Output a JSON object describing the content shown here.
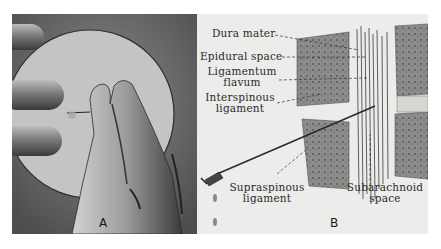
{
  "figure": {
    "panel_a": {
      "letter": "A",
      "description": "Hand pinching a needle inside a circular inset"
    },
    "panel_b": {
      "letter": "B",
      "labels": {
        "dura_mater": "Dura mater",
        "epidural_space": "Epidural space",
        "ligamentum_flavum_1": "Ligamentum",
        "ligamentum_flavum_2": "flavum",
        "interspinous_1": "Interspinous",
        "interspinous_2": "ligament",
        "supraspinous_1": "Supraspinous",
        "supraspinous_2": "ligament",
        "subarachnoid_1": "Subarachnoid",
        "subarachnoid_2": "space"
      }
    }
  }
}
